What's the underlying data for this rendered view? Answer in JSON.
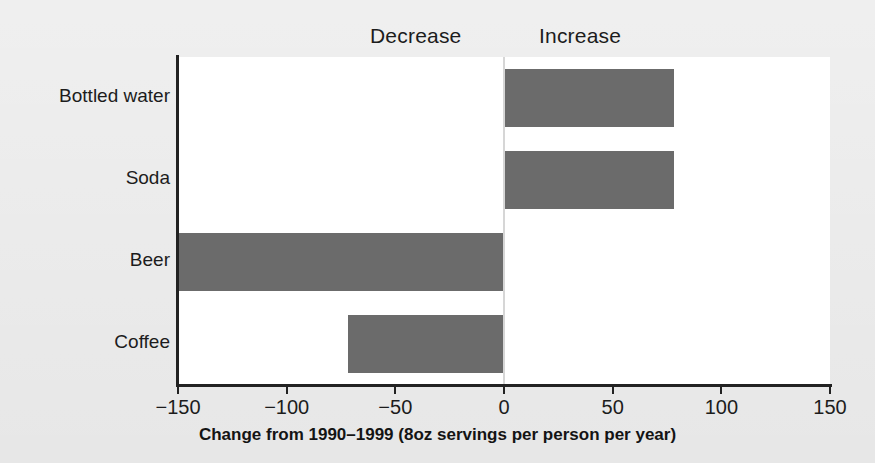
{
  "chart_data": {
    "type": "bar",
    "orientation": "horizontal",
    "title": "",
    "xlabel": "Change from 1990–1999 (8oz servings per person per year)",
    "ylabel": "",
    "categories": [
      "Bottled water",
      "Soda",
      "Beer",
      "Coffee"
    ],
    "values": [
      78,
      78,
      -150,
      -72
    ],
    "xlim": [
      -150,
      150
    ],
    "xticks": [
      -150,
      -100,
      -50,
      0,
      50,
      100,
      150
    ],
    "xticklabels": [
      "−150",
      "−100",
      "−50",
      "0",
      "50",
      "100",
      "150"
    ],
    "grid": false,
    "legend": null,
    "annotations": [
      {
        "text": "Decrease",
        "side": "left-of-zero"
      },
      {
        "text": "Increase",
        "side": "right-of-zero"
      }
    ],
    "series": [
      {
        "name": "Change in servings",
        "values": [
          78,
          78,
          -150,
          -72
        ]
      }
    ]
  },
  "regions": {
    "decrease_label": "Decrease",
    "increase_label": "Increase"
  },
  "axis": {
    "title": "Change from 1990–1999 (8oz servings per person per year)",
    "ticks": [
      {
        "value": -150,
        "label": "−150"
      },
      {
        "value": -100,
        "label": "−100"
      },
      {
        "value": -50,
        "label": "−50"
      },
      {
        "value": 0,
        "label": "0"
      },
      {
        "value": 50,
        "label": "50"
      },
      {
        "value": 100,
        "label": "100"
      },
      {
        "value": 150,
        "label": "150"
      }
    ]
  },
  "colors": {
    "bar_fill": "#6b6b6b",
    "page_background": "#e7e7e7",
    "plot_background": "#ffffff",
    "axis": "#222222",
    "text": "#1c1c1c"
  }
}
